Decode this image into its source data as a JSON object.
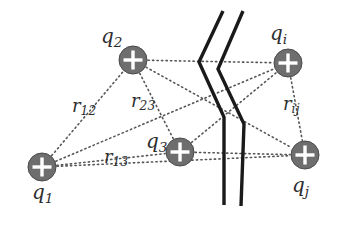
{
  "figure": {
    "background_color": "#ffffff",
    "charge_fill_color": "#6e6e6e",
    "charge_stroke_color": "#4a4a4a",
    "plus_sign_color": "#ffffff",
    "dotted_line_color": "#555555",
    "break_line_color": "#1a1a1a",
    "text_color": "#2e2e2e"
  },
  "charges": [
    {
      "id": "q1",
      "label_base": "q",
      "label_sub": "1",
      "symbol": "+",
      "cx": 42,
      "cy": 167,
      "r": 14,
      "label_x": 32,
      "label_y": 182
    },
    {
      "id": "q2",
      "label_base": "q",
      "label_sub": "2",
      "symbol": "+",
      "cx": 133,
      "cy": 60,
      "r": 14,
      "label_x": 101,
      "label_y": 26
    },
    {
      "id": "q3",
      "label_base": "q",
      "label_sub": "3",
      "symbol": "+",
      "cx": 180,
      "cy": 152,
      "r": 14,
      "label_x": 146,
      "label_y": 131
    },
    {
      "id": "qi",
      "label_base": "q",
      "label_sub": "i",
      "symbol": "+",
      "cx": 288,
      "cy": 63,
      "r": 14,
      "label_x": 270,
      "label_y": 23
    },
    {
      "id": "qj",
      "label_base": "q",
      "label_sub": "j",
      "symbol": "+",
      "cx": 305,
      "cy": 155,
      "r": 14,
      "label_x": 292,
      "label_y": 175
    }
  ],
  "distances": [
    {
      "id": "r12",
      "label_base": "r",
      "label_sub": "12",
      "from": "q1",
      "to": "q2",
      "label_x": 72,
      "label_y": 97
    },
    {
      "id": "r23",
      "label_base": "r",
      "label_sub": "23",
      "from": "q2",
      "to": "q3",
      "label_x": 131,
      "label_y": 92
    },
    {
      "id": "r13",
      "label_base": "r",
      "label_sub": "13",
      "from": "q1",
      "to": "q3",
      "label_x": 104,
      "label_y": 148
    },
    {
      "id": "rij",
      "label_base": "r",
      "label_sub": "ij",
      "from": "qi",
      "to": "qj",
      "label_x": 283,
      "label_y": 95
    }
  ],
  "connections": [
    {
      "from": "q1",
      "to": "q2"
    },
    {
      "from": "q1",
      "to": "q3"
    },
    {
      "from": "q1",
      "to": "qi"
    },
    {
      "from": "q1",
      "to": "qj"
    },
    {
      "from": "q2",
      "to": "q3"
    },
    {
      "from": "q2",
      "to": "qi"
    },
    {
      "from": "q2",
      "to": "qj"
    },
    {
      "from": "q3",
      "to": "qi"
    },
    {
      "from": "q3",
      "to": "qj"
    },
    {
      "from": "qi",
      "to": "qj"
    }
  ],
  "break_lines": [
    {
      "id": "break-line-left",
      "points": "223,11 199,62 224,117 224,205"
    },
    {
      "id": "break-line-right",
      "points": "243,11 218,69 244,124 241,206"
    }
  ]
}
